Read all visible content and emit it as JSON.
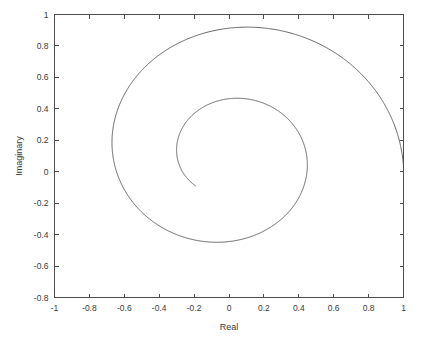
{
  "chart_data": {
    "type": "line",
    "title": "",
    "subtitle": "",
    "xlabel": "Real",
    "ylabel": "Imaginary",
    "xlim": [
      -1,
      1
    ],
    "ylim": [
      -0.8,
      1
    ],
    "grid": false,
    "legend": null,
    "xticks": [
      -1,
      -0.8,
      -0.6,
      -0.4,
      -0.2,
      0,
      0.2,
      0.4,
      0.6,
      0.8,
      1
    ],
    "xtick_labels": [
      "-1",
      "-0.8",
      "-0.6",
      "-0.4",
      "-0.2",
      "0",
      "0.2",
      "0.4",
      "0.6",
      "0.8",
      "1"
    ],
    "yticks": [
      -0.8,
      -0.6,
      -0.4,
      -0.2,
      0,
      0.2,
      0.4,
      0.6,
      0.8,
      1
    ],
    "ytick_labels": [
      "-0.8",
      "-0.6",
      "-0.4",
      "-0.2",
      "0",
      "0.2",
      "0.4",
      "0.6",
      "0.8",
      "1"
    ],
    "line_color": "#53535a",
    "line_width": 0.9,
    "series": [
      {
        "name": "spiral",
        "description": "Inward logarithmic spiral in the complex plane, traced counterclockwise from the right boundary inward.",
        "spiral_params": {
          "center_x": 0.0,
          "center_y": 0.1,
          "r_start": 1.0,
          "r_end": 0.27,
          "theta_start": -0.05,
          "theta_end": 10.2,
          "decay": "exponential"
        },
        "key_points": [
          {
            "real": 1.0,
            "imag": 0.05,
            "note": "start at right axis boundary"
          },
          {
            "real": 0.65,
            "imag": 0.0,
            "note": "outer loop crossing imag=0 on right"
          },
          {
            "real": 0.06,
            "imag": 0.91,
            "note": "outer loop top"
          },
          {
            "real": -0.81,
            "imag": 0.07,
            "note": "outer loop left"
          },
          {
            "real": -0.085,
            "imag": -0.71,
            "note": "outer loop bottom"
          },
          {
            "real": 0.42,
            "imag": 0.0,
            "note": "middle loop crossing imag=0 on right"
          },
          {
            "real": 0.03,
            "imag": 0.59,
            "note": "middle loop top"
          },
          {
            "real": -0.535,
            "imag": 0.06,
            "note": "middle loop left"
          },
          {
            "real": -0.06,
            "imag": -0.465,
            "note": "middle loop bottom"
          },
          {
            "real": 0.04,
            "imag": 0.39,
            "note": "inner arc top"
          },
          {
            "real": -0.18,
            "imag": 0.33,
            "note": "inner free end of spiral"
          }
        ]
      }
    ]
  }
}
